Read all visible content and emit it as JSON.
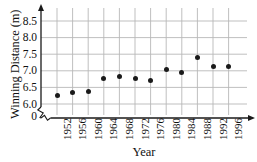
{
  "chart_data": {
    "type": "scatter",
    "title": "",
    "xlabel": "Year",
    "ylabel": "Winning Distance (m)",
    "categories": [
      1952,
      1956,
      1960,
      1964,
      1968,
      1972,
      1976,
      1980,
      1984,
      1988,
      1992,
      1996
    ],
    "values": [
      6.25,
      6.35,
      6.37,
      6.76,
      6.82,
      6.78,
      6.72,
      7.03,
      6.95,
      7.4,
      7.12,
      7.12
    ],
    "x": [
      1952,
      1956,
      1960,
      1964,
      1968,
      1972,
      1976,
      1980,
      1984,
      1988,
      1992,
      1996
    ],
    "y": [
      6.25,
      6.35,
      6.37,
      6.76,
      6.82,
      6.78,
      6.72,
      7.03,
      6.95,
      7.4,
      7.12,
      7.12
    ],
    "xlim": [
      1950,
      1998
    ],
    "ylim": [
      5.95,
      8.75
    ],
    "grid": true,
    "legend": false,
    "axis_break_y": true,
    "marker_color": "#1a1a1a",
    "grid_color": "#b8b8b8",
    "axis_color": "#1a1a1a",
    "y_ticks": [
      "0",
      "6.0",
      "6.5",
      "7.0",
      "7.5",
      "8.0",
      "8.5"
    ],
    "y_tick_values": [
      0,
      6.0,
      6.5,
      7.0,
      7.5,
      8.0,
      8.5
    ],
    "x_ticks": [
      "1952",
      "1956",
      "1960",
      "1964",
      "1968",
      "1972",
      "1976",
      "1980",
      "1984",
      "1988",
      "1992",
      "1996"
    ]
  },
  "axes": {
    "y_title": "Winning Distance (m)",
    "x_title": "Year"
  }
}
